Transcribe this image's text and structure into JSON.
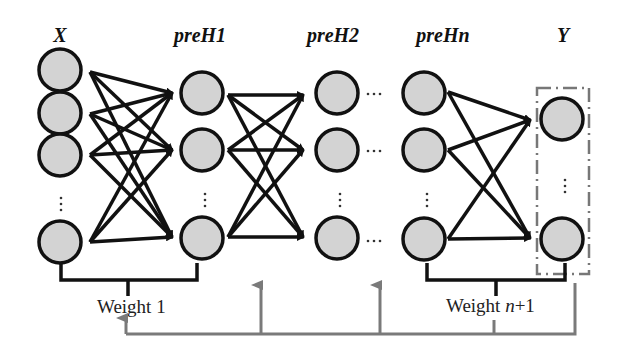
{
  "diagram": {
    "type": "neural-network-pretraining",
    "layers": [
      {
        "id": "X",
        "label": "X",
        "x": 60,
        "nodes_y": [
          90,
          108,
          155,
          240
        ],
        "ellipsis_after": 2
      },
      {
        "id": "preH1",
        "label": "preH1",
        "x": 200,
        "nodes_y": [
          93,
          150,
          238
        ],
        "ellipsis_after": 1
      },
      {
        "id": "preH2",
        "label": "preH2",
        "x": 337,
        "nodes_y": [
          93,
          150,
          238
        ],
        "ellipsis_after": 1
      },
      {
        "id": "preHn",
        "label": "preHn",
        "x": 424,
        "nodes_y": [
          93,
          150,
          238
        ],
        "ellipsis_after": 1
      },
      {
        "id": "Y",
        "label": "Y",
        "x": 562,
        "nodes_y": [
          118,
          240
        ],
        "ellipsis_after": 0
      }
    ],
    "weights": [
      {
        "label_prefix": "Weight ",
        "label_suffix": "1"
      },
      {
        "label_prefix": "Weight ",
        "label_italic": "n",
        "label_suffix": "+1"
      }
    ],
    "feedback_color": "#7a7a7a",
    "node_fill": "#d3d3d3",
    "stroke_color": "#111111"
  },
  "labels": {
    "x": "X",
    "preH1": "preH1",
    "preH2": "preH2",
    "preHn": "preHn",
    "y": "Y",
    "weight1": "Weight 1",
    "weight_n_prefix": "Weight ",
    "weight_n_italic": "n",
    "weight_n_suffix": "+1",
    "ellipsis": "…",
    "vdots": "⋮"
  }
}
